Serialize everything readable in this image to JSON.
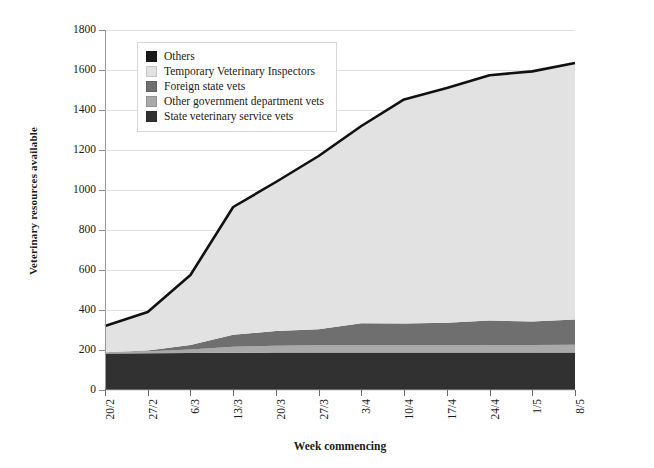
{
  "chart_data": {
    "type": "area",
    "title": "",
    "xlabel": "Week commencing",
    "ylabel": "Veterinary resources available",
    "ylim": [
      0,
      1800
    ],
    "ytick_step": 200,
    "grid": true,
    "stacked": true,
    "legend_position": "top-left",
    "categories": [
      "20/2",
      "27/2",
      "6/3",
      "13/3",
      "20/3",
      "27/3",
      "3/4",
      "10/4",
      "17/4",
      "24/4",
      "1/5",
      "8/5"
    ],
    "yticks": [
      "0",
      "200",
      "400",
      "600",
      "800",
      "1000",
      "1200",
      "1400",
      "1600",
      "1800"
    ],
    "series": [
      {
        "name": "State veterinary service vets",
        "color": "#313131",
        "values": [
          183,
          184,
          185,
          186,
          187,
          188,
          188,
          188,
          188,
          188,
          188,
          188
        ]
      },
      {
        "name": "Other government department vets",
        "color": "#a9a9a9",
        "values": [
          6,
          10,
          18,
          30,
          34,
          36,
          36,
          36,
          36,
          37,
          37,
          38
        ]
      },
      {
        "name": "Foreign state vets",
        "color": "#6f6f6f",
        "values": [
          0,
          4,
          22,
          60,
          74,
          80,
          110,
          108,
          112,
          122,
          118,
          126
        ]
      },
      {
        "name": "Temporary Veterinary Inspectors",
        "color": "#e2e2e2",
        "values": [
          131,
          192,
          350,
          639,
          745,
          866,
          986,
          1121,
          1174,
          1227,
          1250,
          1283
        ]
      },
      {
        "name": "Others",
        "color": "#1a1a1a",
        "values": [
          0,
          0,
          0,
          0,
          0,
          0,
          0,
          0,
          0,
          0,
          0,
          0
        ]
      }
    ],
    "totals": [
      320,
      390,
      575,
      915,
      1040,
      1170,
      1320,
      1453,
      1510,
      1574,
      1593,
      1635
    ],
    "annotations": []
  },
  "legend": {
    "items": [
      {
        "label": "Others",
        "color": "#1a1a1a"
      },
      {
        "label": "Temporary Veterinary Inspectors",
        "color": "#e2e2e2"
      },
      {
        "label": "Foreign state vets",
        "color": "#6f6f6f"
      },
      {
        "label": "Other government department vets",
        "color": "#a9a9a9"
      },
      {
        "label": "State veterinary service vets",
        "color": "#313131"
      }
    ]
  }
}
